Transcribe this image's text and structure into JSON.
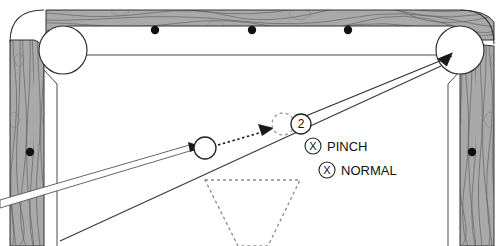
{
  "diagram": {
    "surface_color": "#ffffff",
    "rail_color": "#a9a9a9",
    "rail_grain_color": "#4a4a4a",
    "line_color": "#3b3b3b",
    "diamond_color": "#111111"
  },
  "labels": {
    "pinch": "PINCH",
    "normal": "NORMAL",
    "x_mark": "X",
    "object_ball_number": "2"
  },
  "balls": {
    "cue_ball": {
      "name": "cue-ball",
      "cx": 205,
      "cy": 148,
      "r": 11
    },
    "ghost_ball": {
      "name": "ghost-ball",
      "cx": 283,
      "cy": 124,
      "r": 11
    },
    "object_ball": {
      "name": "object-ball-2",
      "cx": 301,
      "cy": 124,
      "r": 10
    }
  },
  "pockets": [
    {
      "name": "top-left-pocket",
      "cx": 63,
      "cy": 50,
      "r": 24
    },
    {
      "name": "top-right-pocket",
      "cx": 460,
      "cy": 50,
      "r": 24
    }
  ],
  "diamonds": {
    "top_rail": [
      {
        "cx": 155,
        "cy": 30
      },
      {
        "cx": 252,
        "cy": 30
      },
      {
        "cx": 348,
        "cy": 30
      }
    ],
    "left_rail": [
      {
        "cx": 30,
        "cy": 152
      }
    ],
    "right_rail": [
      {
        "cx": 472,
        "cy": 152
      }
    ]
  },
  "markers": {
    "pinch_marker": {
      "cx": 313,
      "cy": 146,
      "r": 8
    },
    "normal_marker": {
      "cx": 327,
      "cy": 170,
      "r": 8
    }
  },
  "shot_lines": {
    "cue_stick_description": "cue-stick",
    "aim_line_description": "long-aim-line",
    "contact_line_description": "dotted-contact-line",
    "object_path_description": "object-ball-path-to-pocket"
  },
  "rack": {
    "name": "rack-triangle-outline"
  }
}
